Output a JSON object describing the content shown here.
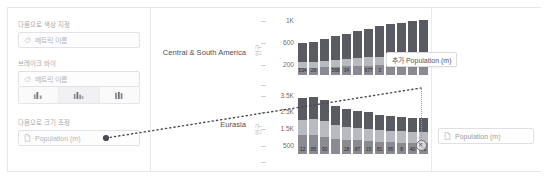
{
  "sidebar": {
    "color_by": {
      "label": "다음으로 색상 지정",
      "icon": "tag-icon",
      "placeholder": "메트릭 이름"
    },
    "break_by": {
      "label": "브레이크 바이",
      "icon": "tag-icon",
      "placeholder": "메트릭 이름"
    },
    "chart_type_buttons": [
      {
        "name": "bars-grouped-icon",
        "active": false
      },
      {
        "name": "bars-stacked-icon",
        "active": true
      },
      {
        "name": "bars-clustered-icon",
        "active": false
      }
    ],
    "size_by": {
      "label": "다음으로 크기 조정",
      "icon": "document-icon",
      "value": "Population (m)"
    }
  },
  "drag": {
    "tooltip_label": "추가 Population (m)",
    "tooltip_icon": "plus-icon",
    "drop_target_icon": "close-icon"
  },
  "right_panel": {
    "drop_field": {
      "icon": "document-icon",
      "value": "Population (m)"
    }
  },
  "chart_data": {
    "type": "bar",
    "title": "",
    "xlabel": "",
    "ylabel": "",
    "grid": false,
    "legend": "none",
    "orientation": "vertical",
    "stacked": true,
    "panels": [
      {
        "row_label": "Central & South America",
        "axis_title": "인구",
        "ylim": [
          0,
          1200
        ],
        "ticks": [
          "1K",
          "600",
          "200"
        ],
        "tick_values": [
          1000,
          600,
          200
        ],
        "bars": [
          {
            "total": 620,
            "label": "534",
            "segments": [
              360,
              120,
              140
            ]
          },
          {
            "total": 640,
            "label": "29",
            "segments": [
              380,
              120,
              140
            ]
          },
          {
            "total": 700,
            "label": "",
            "segments": [
              420,
              130,
              150
            ]
          },
          {
            "total": 760,
            "label": "568",
            "segments": [
              460,
              140,
              160
            ]
          },
          {
            "total": 800,
            "label": "34",
            "segments": [
              490,
              145,
              165
            ]
          },
          {
            "total": 860,
            "label": "",
            "segments": [
              530,
              155,
              175
            ]
          },
          {
            "total": 900,
            "label": "677",
            "segments": [
              560,
              160,
              180
            ]
          },
          {
            "total": 940,
            "label": "3",
            "segments": [
              590,
              165,
              185
            ]
          },
          {
            "total": 980,
            "label": "",
            "segments": [
              620,
              170,
              190
            ]
          },
          {
            "total": 1010,
            "label": "",
            "segments": [
              640,
              175,
              195
            ]
          },
          {
            "total": 1040,
            "label": "",
            "segments": [
              660,
              180,
              200
            ]
          },
          {
            "total": 1070,
            "label": "",
            "segments": [
              680,
              185,
              205
            ]
          }
        ]
      },
      {
        "row_label": "Eurasia",
        "axis_title": "인구",
        "ylim": [
          0,
          4000
        ],
        "ticks": [
          "3.5K",
          "2.5K",
          "1.5K",
          "500"
        ],
        "tick_values": [
          3500,
          2500,
          1500,
          500
        ],
        "bars": [
          {
            "total": 3600,
            "label": "12",
            "segments": [
              1400,
              1000,
              1200
            ]
          },
          {
            "total": 3700,
            "label": "85",
            "segments": [
              1450,
              1050,
              1200
            ]
          },
          {
            "total": 3500,
            "label": "90",
            "segments": [
              1380,
              1000,
              1120
            ]
          },
          {
            "total": 3100,
            "label": "",
            "segments": [
              1200,
              900,
              1000
            ]
          },
          {
            "total": 2900,
            "label": "18",
            "segments": [
              1150,
              850,
              900
            ]
          },
          {
            "total": 2800,
            "label": "87",
            "segments": [
              1100,
              820,
              880
            ]
          },
          {
            "total": 2700,
            "label": "15",
            "segments": [
              1060,
              800,
              840
            ]
          },
          {
            "total": 2500,
            "label": "81",
            "segments": [
              980,
              760,
              760
            ]
          },
          {
            "total": 2450,
            "label": "95",
            "segments": [
              960,
              740,
              750
            ]
          },
          {
            "total": 2400,
            "label": "8",
            "segments": [
              940,
              730,
              730
            ]
          },
          {
            "total": 2350,
            "label": "40",
            "segments": [
              920,
              720,
              710
            ]
          },
          {
            "total": 2300,
            "label": "21",
            "segments": [
              900,
              710,
              690
            ]
          }
        ]
      },
      {
        "row_label": "",
        "axis_title": "인",
        "ylim": [
          0,
          100
        ],
        "ticks": [],
        "tick_values": [],
        "bars": [
          {
            "total": 60,
            "label": "",
            "segments": [
              60
            ]
          },
          {
            "total": 55,
            "label": "",
            "segments": [
              55
            ]
          },
          {
            "total": 50,
            "label": "",
            "segments": [
              50
            ]
          },
          {
            "total": 48,
            "label": "",
            "segments": [
              48
            ]
          },
          {
            "total": 45,
            "label": "",
            "segments": [
              45
            ]
          },
          {
            "total": 43,
            "label": "",
            "segments": [
              43
            ]
          },
          {
            "total": 40,
            "label": "",
            "segments": [
              40
            ]
          },
          {
            "total": 38,
            "label": "",
            "segments": [
              38
            ]
          },
          {
            "total": 36,
            "label": "",
            "segments": [
              36
            ]
          },
          {
            "total": 34,
            "label": "",
            "segments": [
              34
            ]
          },
          {
            "total": 32,
            "label": "",
            "segments": [
              32
            ]
          },
          {
            "total": 30,
            "label": "",
            "segments": [
              30
            ]
          }
        ]
      }
    ],
    "colors": {
      "segment_dark": "#5a5a63",
      "segment_mid": "#8a8a93",
      "segment_light": "#b9b9c1"
    }
  }
}
